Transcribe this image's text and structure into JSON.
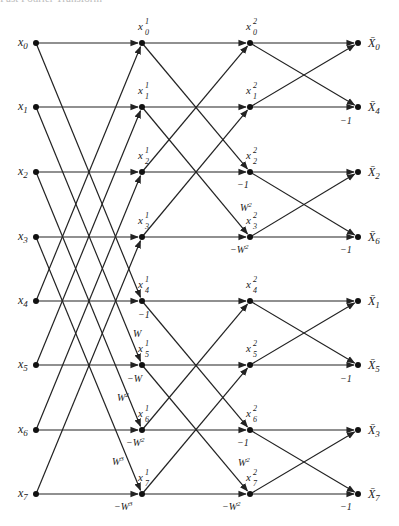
{
  "header": {
    "text": "Fast Fourier Transform"
  },
  "layout": {
    "columns_x": [
      36,
      142,
      250,
      358
    ],
    "rows_y": [
      43,
      107,
      172,
      237,
      301,
      365,
      430,
      494
    ]
  },
  "inputs": [
    "x0",
    "x1",
    "x2",
    "x3",
    "x4",
    "x5",
    "x6",
    "x7"
  ],
  "stage1_nodes": [
    {
      "base": "x",
      "sup": "1",
      "sub": "0"
    },
    {
      "base": "x",
      "sup": "1",
      "sub": "1"
    },
    {
      "base": "x",
      "sup": "1",
      "sub": "2"
    },
    {
      "base": "x",
      "sup": "1",
      "sub": "3"
    },
    {
      "base": "x",
      "sup": "1",
      "sub": "4"
    },
    {
      "base": "x",
      "sup": "1",
      "sub": "5"
    },
    {
      "base": "x",
      "sup": "1",
      "sub": "6"
    },
    {
      "base": "x",
      "sup": "1",
      "sub": "7"
    }
  ],
  "stage2_nodes": [
    {
      "base": "x",
      "sup": "2",
      "sub": "0"
    },
    {
      "base": "x",
      "sup": "2",
      "sub": "1"
    },
    {
      "base": "x",
      "sup": "2",
      "sub": "2"
    },
    {
      "base": "x",
      "sup": "2",
      "sub": "3"
    },
    {
      "base": "x",
      "sup": "2",
      "sub": "4"
    },
    {
      "base": "x",
      "sup": "2",
      "sub": "5"
    },
    {
      "base": "x",
      "sup": "2",
      "sub": "6"
    },
    {
      "base": "x",
      "sup": "2",
      "sub": "7"
    }
  ],
  "outputs": [
    {
      "base": "X̄",
      "sub": "0"
    },
    {
      "base": "X̄",
      "sub": "4"
    },
    {
      "base": "X̄",
      "sub": "2"
    },
    {
      "base": "X̄",
      "sub": "6"
    },
    {
      "base": "X̄",
      "sub": "1"
    },
    {
      "base": "X̄",
      "sub": "5"
    },
    {
      "base": "X̄",
      "sub": "3"
    },
    {
      "base": "X̄",
      "sub": "7"
    }
  ],
  "stage1_butterflies": [
    [
      0,
      4
    ],
    [
      1,
      5
    ],
    [
      2,
      6
    ],
    [
      3,
      7
    ]
  ],
  "stage2_butterflies": [
    [
      0,
      2
    ],
    [
      1,
      3
    ],
    [
      4,
      6
    ],
    [
      5,
      7
    ]
  ],
  "stage3_butterflies": [
    [
      0,
      1
    ],
    [
      2,
      3
    ],
    [
      4,
      5
    ],
    [
      6,
      7
    ]
  ],
  "edge_labels": [
    {
      "text": "−1",
      "sup": "",
      "x": 138,
      "y": 318
    },
    {
      "text": "W",
      "sup": "",
      "x": 133,
      "y": 337
    },
    {
      "text": "−W",
      "sup": "",
      "x": 127,
      "y": 382
    },
    {
      "text": "W",
      "sup": "2",
      "x": 117,
      "y": 401
    },
    {
      "text": "−W",
      "sup": "2",
      "x": 126,
      "y": 446
    },
    {
      "text": "W",
      "sup": "3",
      "x": 112,
      "y": 465
    },
    {
      "text": "−W",
      "sup": "3",
      "x": 114,
      "y": 510
    },
    {
      "text": "−1",
      "sup": "",
      "x": 237,
      "y": 188
    },
    {
      "text": "W",
      "sup": "2",
      "x": 240,
      "y": 211
    },
    {
      "text": "−W",
      "sup": "2",
      "x": 230,
      "y": 253
    },
    {
      "text": "−1",
      "sup": "",
      "x": 237,
      "y": 446
    },
    {
      "text": "W",
      "sup": "2",
      "x": 238,
      "y": 466
    },
    {
      "text": "−W",
      "sup": "2",
      "x": 222,
      "y": 510
    },
    {
      "text": "−1",
      "sup": "",
      "x": 340,
      "y": 124
    },
    {
      "text": "−1",
      "sup": "",
      "x": 340,
      "y": 253
    },
    {
      "text": "−1",
      "sup": "",
      "x": 340,
      "y": 382
    },
    {
      "text": "−1",
      "sup": "",
      "x": 340,
      "y": 510
    }
  ]
}
